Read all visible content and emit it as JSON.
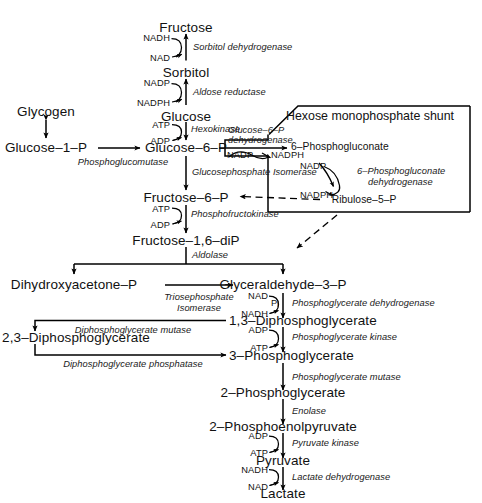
{
  "diagram": {
    "box_title": "Hexose monophosphate shunt"
  },
  "metabolites": {
    "fructose": "Fructose",
    "sorbitol": "Sorbitol",
    "glucose": "Glucose",
    "glycogen": "Glycogen",
    "glucose_1_p": "Glucose–1–P",
    "glucose_6_p": "Glucose–6–P",
    "fructose_6_p": "Fructose–6–P",
    "fructose_16_dip": "Fructose–1,6–diP",
    "dhap": "Dihydroxyacetone–P",
    "gap": "Glyceraldehyde–3–P",
    "bpg_13": "1,3–Diphosphoglycerate",
    "bpg_23": "2,3–Diphosphoglycerate",
    "pg_3": "3–Phosphoglycerate",
    "pg_2": "2–Phosphoglycerate",
    "pep": "2–Phosphoenolpyruvate",
    "pyruvate": "Pyruvate",
    "lactate": "Lactate",
    "phosphogluconate_6": "6–Phosphogluconate",
    "ribulose_5_p": "Ribulose–5–P"
  },
  "enzymes": {
    "sorbitol_dehydrogenase": "Sorbitol dehydrogenase",
    "aldose_reductase": "Aldose reductase",
    "hexokinase": "Hexokinase",
    "phosphoglucomutase": "Phosphoglucomutase",
    "g6pd_line1": "Glucose–6–P",
    "g6pd_line2": "dehydrogenase",
    "glucosephosphate_isomerase": "Glucosephosphate Isomerase",
    "phosphofructokinase": "Phosphofructokinase",
    "pgd_line1": "6–Phosphogluconate",
    "pgd_line2": "dehydrogenase",
    "aldolase": "Aldolase",
    "triosephosphate_line1": "Triosephosphate",
    "triosephosphate_line2": "Isomerase",
    "phosphoglycerate_dehydrogenase": "Phosphoglycerate dehydrogenase",
    "diphosphoglycerate_mutase": "Diphosphoglycerate mutase",
    "phosphoglycerate_kinase": "Phosphoglycerate kinase",
    "diphosphoglycerate_phosphatase": "Diphosphoglycerate phosphatase",
    "phosphoglycerate_mutase": "Phosphoglycerate mutase",
    "enolase": "Enolase",
    "pyruvate_kinase": "Pyruvate kinase",
    "lactate_dehydrogenase": "Lactate dehydrogenase"
  },
  "cofactors": {
    "nadh_1": "NADH",
    "nad_1": "NAD",
    "nadp_1": "NADP",
    "nadph_1": "NADPH",
    "atp_hexokinase": "ATP",
    "adp_hexokinase": "ADP",
    "nadp_g6pd": "NADP",
    "nadph_g6pd": "NADPH",
    "nadp_pgd": "NADP",
    "nadph_pgd": "NADPH",
    "atp_pfk": "ATP",
    "adp_pfk": "ADP",
    "nad_gapdh": "NAD",
    "pi_gapdh": "P",
    "pi_sub": "i",
    "nadh_gapdh": "NADH",
    "adp_pgk": "ADP",
    "atp_pgk": "ATP",
    "adp_pk": "ADP",
    "atp_pk": "ATP",
    "nadh_ldh": "NADH",
    "nad_ldh": "NAD"
  },
  "colors": {
    "ink": "#000000",
    "background": "#ffffff"
  }
}
